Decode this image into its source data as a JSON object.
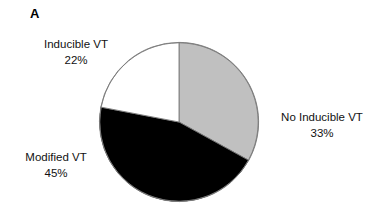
{
  "figure": {
    "panel_label": "A"
  },
  "chart_data": {
    "type": "pie",
    "title": "A",
    "xlabel": "",
    "ylabel": "",
    "start_angle_deg": 0,
    "direction": "clockwise",
    "legend_position": "callout-labels",
    "grid": false,
    "categories": [
      "No Inducible VT",
      "Modified VT",
      "Inducible VT"
    ],
    "values": [
      33,
      45,
      22
    ],
    "value_unit": "%",
    "slices": [
      {
        "label": "No Inducible VT",
        "percent_text": "33%",
        "value": 33,
        "color": "#c0c0c0",
        "start_deg": 0,
        "end_deg": 118.8
      },
      {
        "label": "Modified VT",
        "percent_text": "45%",
        "value": 45,
        "color": "#000000",
        "start_deg": 118.8,
        "end_deg": 280.8
      },
      {
        "label": "Inducible VT",
        "percent_text": "22%",
        "value": 22,
        "color": "#ffffff",
        "start_deg": 280.8,
        "end_deg": 360
      }
    ]
  },
  "labels": {
    "inducible": {
      "name": "Inducible VT",
      "percent": "22%"
    },
    "no_inducible": {
      "name": "No Inducible VT",
      "percent": "33%"
    },
    "modified": {
      "name": "Modified VT",
      "percent": "45%"
    }
  },
  "colors": {
    "slice_gray": "#c0c0c0",
    "slice_black": "#000000",
    "slice_white": "#ffffff",
    "outline": "#7a7a7a",
    "text": "#111111",
    "background": "#ffffff"
  }
}
